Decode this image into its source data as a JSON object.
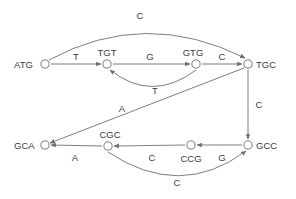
{
  "diagram": {
    "background_color": "#ffffff",
    "stroke_color": "#6e6e6e",
    "text_color": "#3c3c3c",
    "nodes": [
      {
        "id": "ATG",
        "label": "ATG",
        "cx": 45,
        "cy": 64,
        "label_x": 14,
        "label_y": 68,
        "label_anchor": "start"
      },
      {
        "id": "TGT",
        "label": "TGT",
        "cx": 107,
        "cy": 64,
        "label_x": 107,
        "label_y": 56,
        "label_anchor": "middle"
      },
      {
        "id": "GTG",
        "label": "GTG",
        "cx": 196,
        "cy": 64,
        "label_x": 193,
        "label_y": 56,
        "label_anchor": "middle"
      },
      {
        "id": "TGC",
        "label": "TGC",
        "cx": 248,
        "cy": 64,
        "label_x": 256,
        "label_y": 68,
        "label_anchor": "start"
      },
      {
        "id": "GCC",
        "label": "GCC",
        "cx": 248,
        "cy": 145,
        "label_x": 256,
        "label_y": 149,
        "label_anchor": "start"
      },
      {
        "id": "CCG",
        "label": "CCG",
        "cx": 191,
        "cy": 145,
        "label_x": 191,
        "label_y": 162,
        "label_anchor": "middle"
      },
      {
        "id": "CGC",
        "label": "CGC",
        "cx": 108,
        "cy": 146,
        "label_x": 110,
        "label_y": 138,
        "label_anchor": "middle"
      },
      {
        "id": "GCA",
        "label": "GCA",
        "cx": 45,
        "cy": 145,
        "label_x": 14,
        "label_y": 149,
        "label_anchor": "start"
      }
    ],
    "edges": [
      {
        "id": "atg-tgt",
        "from": "ATG",
        "to": "TGT",
        "label": "T",
        "label_x": 76,
        "label_y": 60,
        "path": "M 51 64 L 101 64"
      },
      {
        "id": "tgt-gtg",
        "from": "TGT",
        "to": "GTG",
        "label": "G",
        "label_x": 150,
        "label_y": 60,
        "path": "M 113 64 L 190 64"
      },
      {
        "id": "gtg-tgc",
        "from": "GTG",
        "to": "TGC",
        "label": "C",
        "label_x": 222,
        "label_y": 60,
        "path": "M 202 64 L 242 64"
      },
      {
        "id": "atg-tgc",
        "from": "ATG",
        "to": "TGC",
        "label": "C",
        "label_x": 140,
        "label_y": 19,
        "path": "M 49 60 Q 145 8 245 58"
      },
      {
        "id": "gtg-tgt",
        "from": "GTG",
        "to": "TGT",
        "label": "T",
        "label_x": 155,
        "label_y": 94,
        "path": "M 196 70 Q 152 103 110 70"
      },
      {
        "id": "tgc-gcc",
        "from": "TGC",
        "to": "GCC",
        "label": "C",
        "label_x": 259,
        "label_y": 108,
        "path": "M 248 70 L 248 139"
      },
      {
        "id": "gcc-ccg",
        "from": "GCC",
        "to": "CCG",
        "label": "G",
        "label_x": 222,
        "label_y": 161,
        "path": "M 242 145 L 197 145"
      },
      {
        "id": "ccg-cgc",
        "from": "CCG",
        "to": "CGC",
        "label": "C",
        "label_x": 152,
        "label_y": 161,
        "path": "M 185 145 L 114 146"
      },
      {
        "id": "cgc-gca",
        "from": "CGC",
        "to": "GCA",
        "label": "A",
        "label_x": 75,
        "label_y": 161,
        "path": "M 102 146 L 51 145"
      },
      {
        "id": "tgc-gca",
        "from": "TGC",
        "to": "GCA",
        "label": "A",
        "label_x": 122,
        "label_y": 112,
        "path": "M 244 68 L 50 143"
      },
      {
        "id": "cgc-gcc",
        "from": "CGC",
        "to": "GCC",
        "label": "C",
        "label_x": 177,
        "label_y": 186,
        "path": "M 108 152 Q 180 200 246 151"
      }
    ],
    "legend": {
      "node_count": 8,
      "edge_count": 11,
      "alphabet": [
        "A",
        "C",
        "G",
        "T"
      ]
    }
  }
}
